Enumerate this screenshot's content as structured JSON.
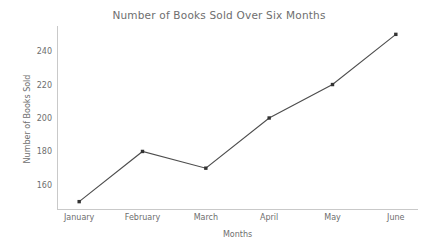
{
  "chart_data": {
    "type": "line",
    "title": "Number of Books Sold Over Six Months",
    "xlabel": "Months",
    "ylabel": "Number of Books Sold",
    "categories": [
      "January",
      "February",
      "March",
      "April",
      "May",
      "June"
    ],
    "values": [
      150,
      180,
      170,
      200,
      220,
      250
    ],
    "series": [
      {
        "name": "Books Sold",
        "values": [
          150,
          180,
          170,
          200,
          220,
          250
        ]
      }
    ],
    "yticks": [
      160,
      180,
      200,
      220,
      240
    ],
    "ylim": [
      145,
      255
    ],
    "xlim": [
      -0.35,
      5.35
    ],
    "grid": false,
    "legend": false,
    "legend_position": "none",
    "line_color": "#4d4d4d",
    "marker": "square",
    "marker_color": "#333333",
    "axis_color": "#c9c9c9",
    "text_color": "#6e6e6e",
    "background_color": "#ffffff"
  }
}
